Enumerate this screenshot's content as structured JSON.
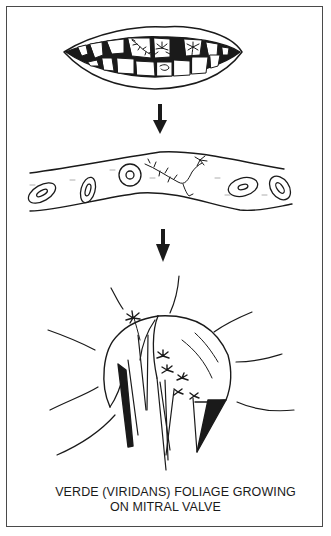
{
  "figure": {
    "panels": [
      {
        "id": "mouth",
        "label": "mouth-with-plants-on-teeth"
      },
      {
        "id": "vessel",
        "label": "blood-vessel-with-vine"
      },
      {
        "id": "valve",
        "label": "mitral-valve-with-palm-trees"
      }
    ],
    "arrows": 2,
    "caption": {
      "line1": "VERDE (VIRIDANS) FOLIAGE GROWING",
      "line2": "ON MITRAL VALVE"
    },
    "colors": {
      "ink": "#1a1a1a",
      "frame": "#4a4a4a",
      "background": "#ffffff"
    }
  }
}
